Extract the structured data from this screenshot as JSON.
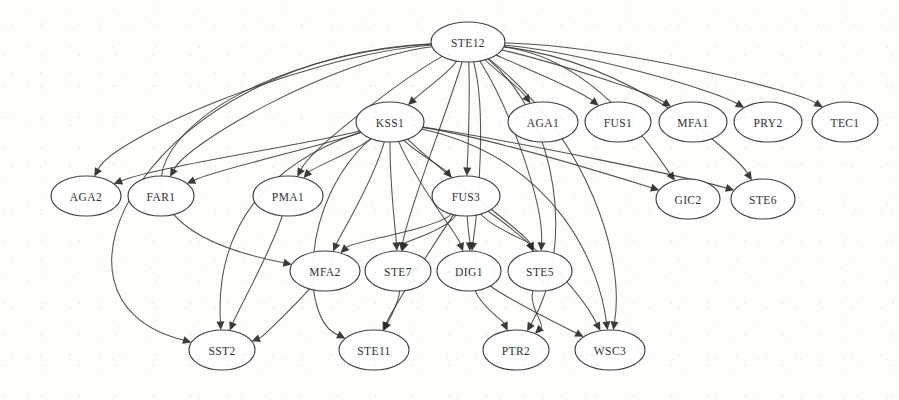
{
  "figure": {
    "type": "directed-graph",
    "width": 899,
    "height": 400,
    "background_color": "#fdfdfc",
    "node_fill_color": "#ffffff",
    "node_stroke_color": "#3a3835",
    "edge_color": "#3c3a38",
    "label_color": "#201f1d"
  },
  "graph": {
    "node_count": 20,
    "edge_count": 44,
    "nodes": [
      {
        "id": "STE12",
        "label": "STE12",
        "cx": 468,
        "cy": 42,
        "rx": 37,
        "ry": 20
      },
      {
        "id": "KSS1",
        "label": "KSS1",
        "cx": 390,
        "cy": 122,
        "rx": 34,
        "ry": 20
      },
      {
        "id": "AGA1",
        "label": "AGA1",
        "cx": 543,
        "cy": 122,
        "rx": 35,
        "ry": 20
      },
      {
        "id": "FUS1",
        "label": "FUS1",
        "cx": 618,
        "cy": 122,
        "rx": 33,
        "ry": 20
      },
      {
        "id": "MFA1",
        "label": "MFA1",
        "cx": 693,
        "cy": 122,
        "rx": 34,
        "ry": 20
      },
      {
        "id": "PRY2",
        "label": "PRY2",
        "cx": 768,
        "cy": 122,
        "rx": 34,
        "ry": 20
      },
      {
        "id": "TEC1",
        "label": "TEC1",
        "cx": 845,
        "cy": 122,
        "rx": 33,
        "ry": 20
      },
      {
        "id": "AGA2",
        "label": "AGA2",
        "cx": 86,
        "cy": 196,
        "rx": 35,
        "ry": 20
      },
      {
        "id": "FAR1",
        "label": "FAR1",
        "cx": 161,
        "cy": 196,
        "rx": 33,
        "ry": 20
      },
      {
        "id": "PMA1",
        "label": "PMA1",
        "cx": 288,
        "cy": 196,
        "rx": 35,
        "ry": 20
      },
      {
        "id": "FUS3",
        "label": "FUS3",
        "cx": 466,
        "cy": 196,
        "rx": 34,
        "ry": 20
      },
      {
        "id": "GIC2",
        "label": "GIC2",
        "cx": 688,
        "cy": 199,
        "rx": 32,
        "ry": 20
      },
      {
        "id": "STE6",
        "label": "STE6",
        "cx": 763,
        "cy": 199,
        "rx": 32,
        "ry": 20
      },
      {
        "id": "MFA2",
        "label": "MFA2",
        "cx": 325,
        "cy": 271,
        "rx": 35,
        "ry": 20
      },
      {
        "id": "STE7",
        "label": "STE7",
        "cx": 398,
        "cy": 271,
        "rx": 33,
        "ry": 20
      },
      {
        "id": "DIG1",
        "label": "DIG1",
        "cx": 469,
        "cy": 271,
        "rx": 32,
        "ry": 20
      },
      {
        "id": "STE5",
        "label": "STE5",
        "cx": 540,
        "cy": 271,
        "rx": 32,
        "ry": 20
      },
      {
        "id": "SST2",
        "label": "SST2",
        "cx": 222,
        "cy": 350,
        "rx": 33,
        "ry": 20
      },
      {
        "id": "STE11",
        "label": "STE11",
        "cx": 374,
        "cy": 350,
        "rx": 35,
        "ry": 20
      },
      {
        "id": "PTR2",
        "label": "PTR2",
        "cx": 516,
        "cy": 350,
        "rx": 33,
        "ry": 20
      },
      {
        "id": "WSC3",
        "label": "WSC3",
        "cx": 610,
        "cy": 350,
        "rx": 35,
        "ry": 20
      }
    ],
    "edges": [
      {
        "from": "STE12",
        "to": "KSS1"
      },
      {
        "from": "STE12",
        "to": "AGA1"
      },
      {
        "from": "STE12",
        "to": "FUS1"
      },
      {
        "from": "STE12",
        "to": "MFA1"
      },
      {
        "from": "STE12",
        "to": "PRY2"
      },
      {
        "from": "STE12",
        "to": "TEC1"
      },
      {
        "from": "STE12",
        "to": "AGA2"
      },
      {
        "from": "STE12",
        "to": "FAR1"
      },
      {
        "from": "STE12",
        "to": "PMA1"
      },
      {
        "from": "STE12",
        "to": "FUS3"
      },
      {
        "from": "STE12",
        "to": "GIC2"
      },
      {
        "from": "STE12",
        "to": "STE6"
      },
      {
        "from": "STE12",
        "to": "MFA2"
      },
      {
        "from": "STE12",
        "to": "STE7"
      },
      {
        "from": "STE12",
        "to": "DIG1"
      },
      {
        "from": "STE12",
        "to": "STE5"
      },
      {
        "from": "STE12",
        "to": "SST2"
      },
      {
        "from": "STE12",
        "to": "WSC3"
      },
      {
        "from": "STE12",
        "to": "PTR2"
      },
      {
        "from": "KSS1",
        "to": "AGA2"
      },
      {
        "from": "KSS1",
        "to": "FAR1"
      },
      {
        "from": "KSS1",
        "to": "PMA1"
      },
      {
        "from": "KSS1",
        "to": "FUS3"
      },
      {
        "from": "KSS1",
        "to": "GIC2"
      },
      {
        "from": "KSS1",
        "to": "STE6"
      },
      {
        "from": "KSS1",
        "to": "MFA2"
      },
      {
        "from": "KSS1",
        "to": "STE7"
      },
      {
        "from": "KSS1",
        "to": "DIG1"
      },
      {
        "from": "KSS1",
        "to": "STE5"
      },
      {
        "from": "KSS1",
        "to": "SST2"
      },
      {
        "from": "KSS1",
        "to": "STE11"
      },
      {
        "from": "KSS1",
        "to": "WSC3"
      },
      {
        "from": "FUS3",
        "to": "MFA2"
      },
      {
        "from": "FUS3",
        "to": "STE7"
      },
      {
        "from": "FUS3",
        "to": "DIG1"
      },
      {
        "from": "FUS3",
        "to": "STE5"
      },
      {
        "from": "FUS3",
        "to": "STE11"
      },
      {
        "from": "FUS3",
        "to": "WSC3"
      },
      {
        "from": "STE7",
        "to": "STE11"
      },
      {
        "from": "DIG1",
        "to": "PTR2"
      },
      {
        "from": "DIG1",
        "to": "WSC3"
      },
      {
        "from": "STE5",
        "to": "PTR2"
      },
      {
        "from": "MFA2",
        "to": "SST2"
      },
      {
        "from": "PMA1",
        "to": "SST2"
      }
    ],
    "edge_geometry": [
      {
        "from": "STE12",
        "to": "KSS1",
        "c1x": 450,
        "c1y": 72,
        "c2x": 424,
        "c2y": 90
      },
      {
        "from": "STE12",
        "to": "AGA1",
        "c1x": 495,
        "c1y": 70,
        "c2x": 520,
        "c2y": 88
      },
      {
        "from": "STE12",
        "to": "FUS1",
        "c1x": 520,
        "c1y": 66,
        "c2x": 580,
        "c2y": 90
      },
      {
        "from": "STE12",
        "to": "MFA1",
        "c1x": 545,
        "c1y": 60,
        "c2x": 650,
        "c2y": 92
      },
      {
        "from": "STE12",
        "to": "PRY2",
        "c1x": 580,
        "c1y": 52,
        "c2x": 715,
        "c2y": 90
      },
      {
        "from": "STE12",
        "to": "TEC1",
        "c1x": 620,
        "c1y": 46,
        "c2x": 800,
        "c2y": 92
      },
      {
        "from": "STE12",
        "to": "GIC2",
        "c1x": 600,
        "c1y": 60,
        "c2x": 660,
        "c2y": 160
      },
      {
        "from": "STE12",
        "to": "STE6",
        "c1x": 640,
        "c1y": 64,
        "c2x": 740,
        "c2y": 160
      },
      {
        "from": "STE12",
        "to": "AGA2",
        "c1x": 300,
        "c1y": 56,
        "c2x": 110,
        "c2y": 140
      },
      {
        "from": "STE12",
        "to": "FAR1",
        "c1x": 330,
        "c1y": 60,
        "c2x": 185,
        "c2y": 145
      },
      {
        "from": "STE12",
        "to": "PMA1",
        "c1x": 400,
        "c1y": 80,
        "c2x": 310,
        "c2y": 150
      },
      {
        "from": "STE12",
        "to": "FUS3",
        "c1x": 470,
        "c1y": 95,
        "c2x": 468,
        "c2y": 150
      },
      {
        "from": "STE12",
        "to": "MFA2",
        "c1x": 200,
        "c1y": 58,
        "c2x": 38,
        "c2y": 215
      },
      {
        "from": "STE12",
        "to": "SST2",
        "c1x": 150,
        "c1y": 58,
        "c2x": 20,
        "c2y": 300
      },
      {
        "from": "STE12",
        "to": "STE7",
        "c1x": 448,
        "c1y": 110,
        "c2x": 408,
        "c2y": 210
      },
      {
        "from": "STE12",
        "to": "DIG1",
        "c1x": 487,
        "c1y": 110,
        "c2x": 478,
        "c2y": 208
      },
      {
        "from": "STE12",
        "to": "STE5",
        "c1x": 512,
        "c1y": 112,
        "c2x": 544,
        "c2y": 206
      },
      {
        "from": "STE12",
        "to": "PTR2",
        "c1x": 560,
        "c1y": 120,
        "c2x": 575,
        "c2y": 250
      },
      {
        "from": "STE12",
        "to": "WSC3",
        "c1x": 590,
        "c1y": 140,
        "c2x": 625,
        "c2y": 260
      },
      {
        "from": "KSS1",
        "to": "AGA2",
        "c1x": 330,
        "c1y": 140,
        "c2x": 150,
        "c2y": 168
      },
      {
        "from": "KSS1",
        "to": "FAR1",
        "c1x": 330,
        "c1y": 144,
        "c2x": 215,
        "c2y": 170
      },
      {
        "from": "KSS1",
        "to": "PMA1",
        "c1x": 358,
        "c1y": 150,
        "c2x": 312,
        "c2y": 168
      },
      {
        "from": "KSS1",
        "to": "FUS3",
        "c1x": 412,
        "c1y": 150,
        "c2x": 444,
        "c2y": 168
      },
      {
        "from": "KSS1",
        "to": "GIC2",
        "c1x": 500,
        "c1y": 140,
        "c2x": 620,
        "c2y": 178
      },
      {
        "from": "KSS1",
        "to": "STE6",
        "c1x": 520,
        "c1y": 142,
        "c2x": 700,
        "c2y": 180
      },
      {
        "from": "KSS1",
        "to": "MFA2",
        "c1x": 372,
        "c1y": 185,
        "c2x": 340,
        "c2y": 235
      },
      {
        "from": "KSS1",
        "to": "STE7",
        "c1x": 390,
        "c1y": 190,
        "c2x": 396,
        "c2y": 235
      },
      {
        "from": "KSS1",
        "to": "DIG1",
        "c1x": 420,
        "c1y": 190,
        "c2x": 458,
        "c2y": 235
      },
      {
        "from": "KSS1",
        "to": "STE5",
        "c1x": 450,
        "c1y": 180,
        "c2x": 528,
        "c2y": 235
      },
      {
        "from": "KSS1",
        "to": "SST2",
        "c1x": 222,
        "c1y": 180,
        "c2x": 218,
        "c2y": 280
      },
      {
        "from": "KSS1",
        "to": "STE11",
        "c1x": 300,
        "c1y": 200,
        "c2x": 300,
        "c2y": 320
      },
      {
        "from": "KSS1",
        "to": "WSC3",
        "c1x": 560,
        "c1y": 160,
        "c2x": 600,
        "c2y": 270
      },
      {
        "from": "FUS3",
        "to": "MFA2",
        "c1x": 440,
        "c1y": 228,
        "c2x": 350,
        "c2y": 242
      },
      {
        "from": "FUS3",
        "to": "STE7",
        "c1x": 448,
        "c1y": 230,
        "c2x": 404,
        "c2y": 242
      },
      {
        "from": "FUS3",
        "to": "DIG1",
        "c1x": 468,
        "c1y": 230,
        "c2x": 470,
        "c2y": 242
      },
      {
        "from": "FUS3",
        "to": "STE5",
        "c1x": 492,
        "c1y": 228,
        "c2x": 530,
        "c2y": 242
      },
      {
        "from": "FUS3",
        "to": "STE11",
        "c1x": 430,
        "c1y": 250,
        "c2x": 392,
        "c2y": 310
      },
      {
        "from": "FUS3",
        "to": "WSC3",
        "c1x": 530,
        "c1y": 240,
        "c2x": 580,
        "c2y": 290
      },
      {
        "from": "STE7",
        "to": "STE11",
        "c1x": 400,
        "c1y": 300,
        "c2x": 388,
        "c2y": 322
      },
      {
        "from": "DIG1",
        "to": "PTR2",
        "c1x": 480,
        "c1y": 305,
        "c2x": 504,
        "c2y": 322
      },
      {
        "from": "DIG1",
        "to": "WSC3",
        "c1x": 510,
        "c1y": 300,
        "c2x": 566,
        "c2y": 328
      },
      {
        "from": "STE5",
        "to": "PTR2",
        "c1x": 528,
        "c1y": 305,
        "c2x": 545,
        "c2y": 325
      },
      {
        "from": "MFA2",
        "to": "SST2",
        "c1x": 300,
        "c1y": 300,
        "c2x": 262,
        "c2y": 338
      },
      {
        "from": "PMA1",
        "to": "SST2",
        "c1x": 272,
        "c1y": 250,
        "c2x": 238,
        "c2y": 310
      }
    ]
  }
}
